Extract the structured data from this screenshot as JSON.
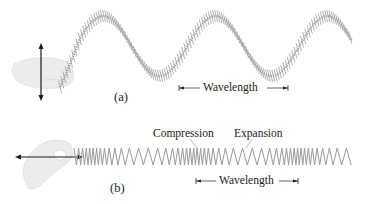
{
  "figure": {
    "part_a": {
      "label": "(a)",
      "wave_type": "transverse",
      "wavelength_label": "Wavelength"
    },
    "part_b": {
      "label": "(b)",
      "wave_type": "longitudinal",
      "compression_label": "Compression",
      "expansion_label": "Expansion",
      "wavelength_label": "Wavelength"
    },
    "colors": {
      "spring": "#9a9a9a",
      "arrow": "#1a1a1a",
      "hand": "#e6e6e6",
      "text": "#222222"
    }
  }
}
